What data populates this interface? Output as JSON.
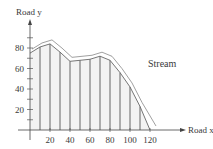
{
  "chart_data": {
    "type": "line",
    "title": "",
    "xlabel": "Road x",
    "ylabel": "Road y",
    "x_ticks": [
      20,
      40,
      60,
      80,
      100,
      120
    ],
    "y_ticks": [
      20,
      40,
      60,
      80
    ],
    "xlim": [
      0,
      130
    ],
    "ylim": [
      0,
      100
    ],
    "grid": false,
    "annotations": [
      {
        "text": "Stream",
        "x": 95,
        "y": 72
      }
    ],
    "series": [
      {
        "name": "Stream",
        "x": [
          0,
          10,
          20,
          30,
          40,
          50,
          60,
          70,
          80,
          90,
          100,
          110,
          120
        ],
        "y": [
          75,
          81,
          84,
          76,
          67,
          68,
          69,
          72,
          68,
          56,
          42,
          23,
          0
        ]
      }
    ],
    "vertical_segments_x": [
      10,
      20,
      30,
      40,
      50,
      60,
      70,
      80,
      90,
      100,
      110
    ]
  },
  "labels": {
    "x_axis": "Road x",
    "y_axis": "Road y",
    "stream": "Stream",
    "xt": [
      "20",
      "40",
      "60",
      "80",
      "100",
      "120"
    ],
    "yt": [
      "20",
      "40",
      "60",
      "80"
    ]
  }
}
